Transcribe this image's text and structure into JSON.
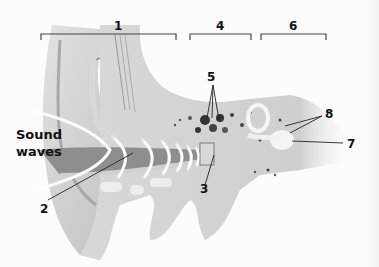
{
  "diagram": {
    "type": "anatomy",
    "caption_text": "Sound waves",
    "caption_lines": [
      "Sound",
      "waves"
    ],
    "labels": [
      {
        "id": "1",
        "text": "1",
        "x": 117,
        "y": 20
      },
      {
        "id": "2",
        "text": "2",
        "x": 40,
        "y": 205
      },
      {
        "id": "3",
        "text": "3",
        "x": 200,
        "y": 188
      },
      {
        "id": "4",
        "text": "4",
        "x": 217,
        "y": 20
      },
      {
        "id": "5",
        "text": "5",
        "x": 208,
        "y": 70
      },
      {
        "id": "6",
        "text": "6",
        "x": 288,
        "y": 20
      },
      {
        "id": "7",
        "text": "7",
        "x": 347,
        "y": 139
      },
      {
        "id": "8",
        "text": "8",
        "x": 326,
        "y": 108
      }
    ],
    "brackets": [
      {
        "label": "1",
        "x1": 41,
        "x2": 176,
        "y": 34
      },
      {
        "label": "4",
        "x1": 190,
        "x2": 251,
        "y": 34
      },
      {
        "label": "6",
        "x1": 261,
        "x2": 326,
        "y": 34
      }
    ],
    "colors": {
      "background": "#fcfcfc",
      "tissue_light": "#e6e6e6",
      "tissue_mid": "#c9c9c9",
      "tissue_dark": "#8f8f8f",
      "bone_spots": "#333333",
      "leader_line": "#222222",
      "label_text": "#111111"
    }
  }
}
